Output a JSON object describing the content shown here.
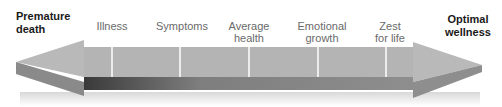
{
  "diagram": {
    "left_end": {
      "line1": "Premature",
      "line2": "death"
    },
    "right_end": {
      "line1": "Optimal",
      "line2": "wellness"
    },
    "stages": [
      {
        "line1": "Illness",
        "line2": ""
      },
      {
        "line1": "Symptoms",
        "line2": ""
      },
      {
        "line1": "Average",
        "line2": "health"
      },
      {
        "line1": "Emotional",
        "line2": "growth"
      },
      {
        "line1": "Zest",
        "line2": "for life"
      }
    ],
    "colors": {
      "arrow_face": "#b4b4b4",
      "arrow_side": "#8c8c8c",
      "band_dark": "#3a3a3a",
      "band_light": "#8e8e8e",
      "divider": "#ffffff"
    }
  }
}
